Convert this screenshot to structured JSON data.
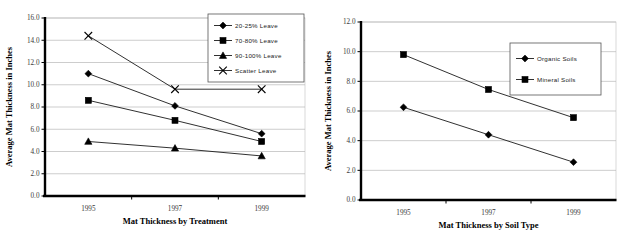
{
  "chart_data": [
    {
      "id": "left",
      "type": "line",
      "title": "",
      "xlabel": "Mat Thickness by Treatment",
      "ylabel": "Average Mat Thickness in Inches",
      "categories": [
        "1995",
        "1997",
        "1999"
      ],
      "ylim": [
        0.0,
        16.0
      ],
      "yticks": [
        "0.0",
        "2.0",
        "4.0",
        "6.0",
        "8.0",
        "10.0",
        "12.0",
        "14.0",
        "16.0"
      ],
      "grid": true,
      "legend_position": "top-right",
      "series": [
        {
          "name": "20-25% Leave",
          "marker": "diamond",
          "values": [
            11.0,
            8.1,
            5.6
          ]
        },
        {
          "name": "70-80% Leave",
          "marker": "square",
          "values": [
            8.6,
            6.8,
            4.9
          ]
        },
        {
          "name": "90-100% Leave",
          "marker": "triangle",
          "values": [
            4.9,
            4.3,
            3.6
          ]
        },
        {
          "name": "Scatter Leave",
          "marker": "cross",
          "values": [
            14.4,
            9.6,
            9.6
          ]
        }
      ]
    },
    {
      "id": "right",
      "type": "line",
      "title": "",
      "xlabel": "Mat Thickness by Soil Type",
      "ylabel": "Average Mat Thickness in Inches",
      "categories": [
        "1995",
        "1997",
        "1999"
      ],
      "ylim": [
        0.0,
        12.0
      ],
      "yticks": [
        "0.0",
        "2.0",
        "4.0",
        "6.0",
        "8.0",
        "10.0",
        "12.0"
      ],
      "grid": true,
      "legend_position": "upper-center-right",
      "series": [
        {
          "name": "Organic Soils",
          "marker": "diamond",
          "values": [
            6.25,
            4.4,
            2.55
          ]
        },
        {
          "name": "Mineral Soils",
          "marker": "square",
          "values": [
            9.8,
            7.45,
            5.55
          ]
        }
      ]
    }
  ],
  "colors": {
    "background": "#ffffff",
    "ink": "#000000",
    "gridline": "#b8b8b8",
    "tick_text": "#3a3a3a"
  }
}
